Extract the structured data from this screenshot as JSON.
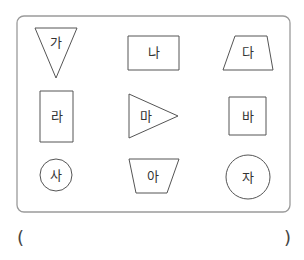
{
  "panel": {
    "x": 17,
    "y": 16,
    "width": 273,
    "height": 196,
    "radius": 7,
    "border_color": "#9a9a9a"
  },
  "shapes": [
    {
      "label": "가",
      "type": "inverted-triangle",
      "points": "35,28 77,28 56,78",
      "text_x": 56,
      "text_y": 47
    },
    {
      "label": "나",
      "type": "rectangle",
      "points": "128,36 179,36 179,70 128,70",
      "text_x": 153.5,
      "text_y": 57
    },
    {
      "label": "다",
      "type": "trapezoid",
      "points": "235,36 267,36 273,70 223,70",
      "text_x": 248,
      "text_y": 57
    },
    {
      "label": "라",
      "type": "tall-rectangle",
      "points": "40,91 73,91 73,142 40,142",
      "text_x": 56.5,
      "text_y": 121
    },
    {
      "label": "마",
      "type": "right-pointing-triangle",
      "points": "129,94 178,116 129,138",
      "text_x": 146,
      "text_y": 121
    },
    {
      "label": "바",
      "type": "square",
      "points": "229,97 266,97 266,135 229,135",
      "text_x": 247.5,
      "text_y": 121
    },
    {
      "label": "사",
      "type": "small-circle",
      "cx": 56,
      "cy": 175,
      "r": 16,
      "text_x": 56,
      "text_y": 180
    },
    {
      "label": "아",
      "type": "inverted-trapezoid",
      "points": "129,159 179,159 167,193 136,193",
      "text_x": 153,
      "text_y": 181
    },
    {
      "label": "자",
      "type": "large-circle",
      "cx": 248,
      "cy": 177,
      "r": 22,
      "text_x": 248,
      "text_y": 182
    }
  ],
  "answer": {
    "open_paren": "(",
    "close_paren": ")",
    "value": ""
  },
  "colors": {
    "stroke": "#555555",
    "text": "#333333"
  }
}
